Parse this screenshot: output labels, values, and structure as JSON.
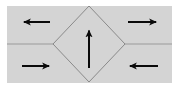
{
  "figure": {
    "canvas": {
      "width": 179,
      "height": 89
    },
    "colors": {
      "page_background": "#ffffff",
      "panel_fill": "#d4d4d4",
      "diamond_fill": "#d4d4d4",
      "diamond_stroke": "#8a8a8a",
      "center_line": "#9a9a9a",
      "arrow": "#0a0a0a"
    },
    "panel": {
      "name": "gray-panel",
      "x": 7,
      "y": 6,
      "width": 165,
      "height": 77
    },
    "center_line": {
      "name": "horizontal-center-line",
      "y": 44,
      "x_start": 7,
      "x_end": 172,
      "stroke_width": 1.2
    },
    "diamond": {
      "name": "center-diamond",
      "center_x": 89,
      "center_y": 44,
      "half_width": 36,
      "half_height": 38,
      "stroke_width": 1,
      "points": "89,6 125,44 89,82 53,44"
    },
    "arrows": [
      {
        "name": "arrow-top-left",
        "direction": "left",
        "label": "←",
        "x1": 50,
        "y1": 22,
        "x2": 20,
        "y2": 22,
        "stroke_width": 2.0,
        "head_length": 7,
        "head_width": 7
      },
      {
        "name": "arrow-top-right",
        "direction": "right",
        "label": "→",
        "x1": 128,
        "y1": 22,
        "x2": 160,
        "y2": 22,
        "stroke_width": 2.0,
        "head_length": 7,
        "head_width": 7
      },
      {
        "name": "arrow-bottom-left",
        "direction": "right",
        "label": "→",
        "x1": 22,
        "y1": 66,
        "x2": 53,
        "y2": 66,
        "stroke_width": 2.0,
        "head_length": 7,
        "head_width": 7
      },
      {
        "name": "arrow-bottom-right",
        "direction": "left",
        "label": "←",
        "x1": 158,
        "y1": 66,
        "x2": 126,
        "y2": 66,
        "stroke_width": 2.0,
        "head_length": 7,
        "head_width": 7
      },
      {
        "name": "arrow-center-up",
        "direction": "up",
        "label": "↑",
        "x1": 89,
        "y1": 68,
        "x2": 89,
        "y2": 26,
        "stroke_width": 2.0,
        "head_length": 8,
        "head_width": 7
      }
    ]
  }
}
